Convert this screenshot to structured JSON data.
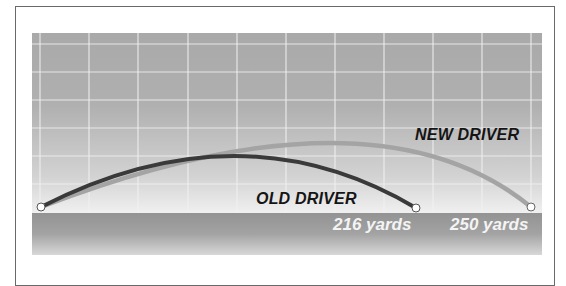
{
  "chart_data": {
    "type": "line",
    "title": "",
    "xlabel": "",
    "ylabel": "",
    "grid": true,
    "series": [
      {
        "name": "OLD DRIVER",
        "color": "#3a3a3a",
        "distance_yards": 216,
        "distance_label": "216 yards",
        "path_points_px": [
          [
            41,
            207
          ],
          [
            235,
            156
          ],
          [
            416,
            208
          ]
        ]
      },
      {
        "name": "NEW DRIVER",
        "color": "#a4a4a4",
        "distance_yards": 250,
        "distance_label": "250 yards",
        "path_points_px": [
          [
            41,
            207
          ],
          [
            330,
            143
          ],
          [
            531,
            207
          ]
        ]
      }
    ]
  },
  "labels": {
    "old_driver": "OLD DRIVER",
    "new_driver": "NEW DRIVER",
    "old_distance": "216 yards",
    "new_distance": "250 yards"
  },
  "colors": {
    "old_arc": "#3a3a3a",
    "new_arc": "#a4a4a4",
    "grid": "#f2f2f2",
    "frame": "#6a6a6a"
  },
  "grid": {
    "vertical_x": [
      40,
      89,
      138,
      188,
      237,
      286,
      335,
      384,
      433,
      482,
      531
    ],
    "horizontal_y": [
      44,
      72,
      100,
      128,
      156,
      184
    ]
  }
}
